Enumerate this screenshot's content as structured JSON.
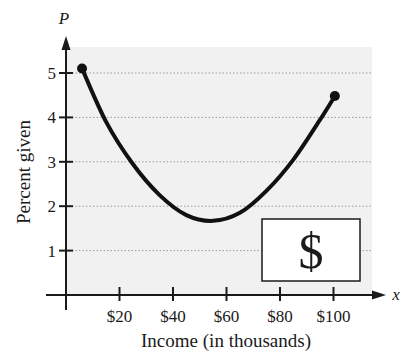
{
  "chart_data": {
    "type": "line",
    "title": "",
    "xlabel": "Income (in thousands)",
    "ylabel": "Percent given",
    "x_var": "x",
    "y_var": "P",
    "xlim": [
      0,
      115
    ],
    "ylim": [
      0,
      5.5
    ],
    "x_ticks": [
      20,
      40,
      60,
      80,
      100
    ],
    "x_tick_labels": [
      "$20",
      "$40",
      "$60",
      "$80",
      "$100"
    ],
    "y_ticks": [
      1,
      2,
      3,
      4,
      5
    ],
    "y_tick_labels": [
      "1",
      "2",
      "3",
      "4",
      "5"
    ],
    "grid": "horizontal dotted",
    "series": [
      {
        "name": "Percent given",
        "x": [
          6,
          15,
          25,
          35,
          45,
          55,
          65,
          75,
          85,
          95,
          100.5
        ],
        "y": [
          5.1,
          3.9,
          2.95,
          2.25,
          1.8,
          1.67,
          1.85,
          2.35,
          3.05,
          3.95,
          4.48
        ],
        "endpoints_marked": true
      }
    ],
    "annotations": [
      {
        "type": "icon-box",
        "text": "$"
      }
    ]
  },
  "colors": {
    "plot_background": "#f1f1f1",
    "line": "#111111",
    "grid": "#9a9a9a"
  }
}
